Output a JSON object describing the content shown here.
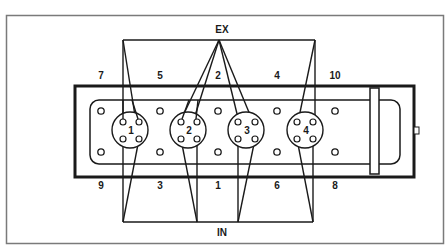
{
  "diagram": {
    "exhaust_label": "EX",
    "intake_label": "IN",
    "top_bolt_labels": [
      "7",
      "5",
      "2",
      "4",
      "10"
    ],
    "bottom_bolt_labels": [
      "9",
      "3",
      "1",
      "6",
      "8"
    ],
    "cylinder_labels": [
      "1",
      "2",
      "3",
      "4"
    ],
    "colors": {
      "line": "#1a1a1a",
      "frame": "#7a7a7a",
      "background": "#ffffff"
    }
  }
}
